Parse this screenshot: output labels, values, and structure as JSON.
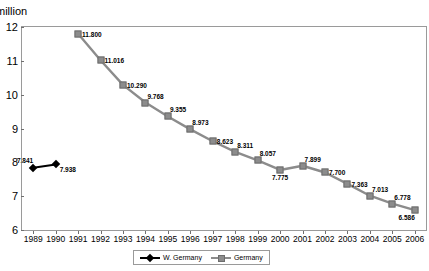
{
  "axis": {
    "y_unit_label": "million",
    "y_ticks": [
      "12",
      "11",
      "10",
      "9",
      "8",
      "7",
      "6"
    ],
    "x_ticks": [
      "1989",
      "1990",
      "1991",
      "1992",
      "1993",
      "1994",
      "1995",
      "1996",
      "1997",
      "1998",
      "1999",
      "2000",
      "2001",
      "2002",
      "2003",
      "2004",
      "2005",
      "2006"
    ]
  },
  "legend": {
    "items": [
      {
        "label": "W. Germany",
        "color": "#000000",
        "marker": "diamond"
      },
      {
        "label": "Germany",
        "color": "#8c8c8c",
        "marker": "square"
      }
    ]
  },
  "chart_data": {
    "type": "line",
    "title": "",
    "xlabel": "",
    "ylabel": "million",
    "ylim": [
      6,
      12
    ],
    "xlim": [
      1989,
      2006
    ],
    "grid": false,
    "legend_position": "bottom",
    "x": [
      1989,
      1990,
      1991,
      1992,
      1993,
      1994,
      1995,
      1996,
      1997,
      1998,
      1999,
      2000,
      2001,
      2002,
      2003,
      2004,
      2005,
      2006
    ],
    "series": [
      {
        "name": "W. Germany",
        "color": "#000000",
        "marker": "diamond",
        "points": [
          {
            "x": 1989,
            "y": 7.841,
            "label": "7.841",
            "label_pos": "above-left"
          },
          {
            "x": 1990,
            "y": 7.938,
            "label": "7.938",
            "label_pos": "below-right"
          }
        ]
      },
      {
        "name": "Germany",
        "color": "#8c8c8c",
        "marker": "square",
        "points": [
          {
            "x": 1991,
            "y": 11.8,
            "label": "11.800",
            "label_pos": "right"
          },
          {
            "x": 1992,
            "y": 11.016,
            "label": "11.016",
            "label_pos": "right"
          },
          {
            "x": 1993,
            "y": 10.29,
            "label": "10.290",
            "label_pos": "right"
          },
          {
            "x": 1994,
            "y": 9.768,
            "label": "9.768",
            "label_pos": "above-right"
          },
          {
            "x": 1995,
            "y": 9.355,
            "label": "9.355",
            "label_pos": "above-right"
          },
          {
            "x": 1996,
            "y": 8.973,
            "label": "8.973",
            "label_pos": "above-right"
          },
          {
            "x": 1997,
            "y": 8.623,
            "label": "8.623",
            "label_pos": "right"
          },
          {
            "x": 1998,
            "y": 8.311,
            "label": "8.311",
            "label_pos": "above-right"
          },
          {
            "x": 1999,
            "y": 8.057,
            "label": "8.057",
            "label_pos": "above-right"
          },
          {
            "x": 2000,
            "y": 7.775,
            "label": "7.775",
            "label_pos": "below"
          },
          {
            "x": 2001,
            "y": 7.899,
            "label": "7.899",
            "label_pos": "above-right"
          },
          {
            "x": 2002,
            "y": 7.7,
            "label": "7.700",
            "label_pos": "right"
          },
          {
            "x": 2003,
            "y": 7.363,
            "label": "7.363",
            "label_pos": "right"
          },
          {
            "x": 2004,
            "y": 7.013,
            "label": "7.013",
            "label_pos": "above-right"
          },
          {
            "x": 2005,
            "y": 6.778,
            "label": "6.778",
            "label_pos": "above-right"
          },
          {
            "x": 2006,
            "y": 6.586,
            "label": "6.586",
            "label_pos": "below-left"
          }
        ]
      }
    ]
  }
}
